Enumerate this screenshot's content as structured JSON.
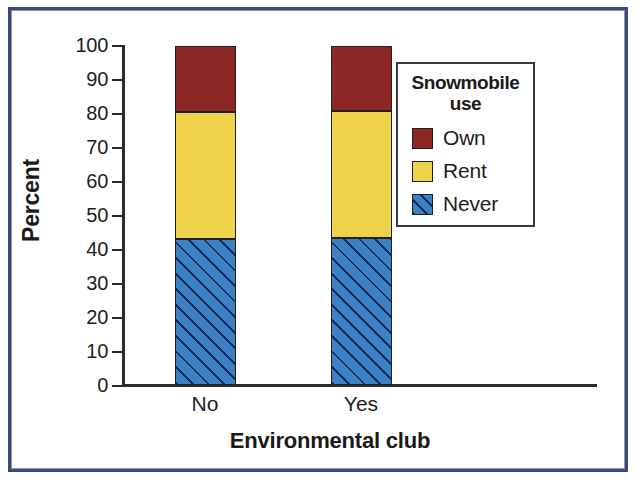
{
  "figure": {
    "border_color": "#3c4a79",
    "background": "#ffffff"
  },
  "chart_data": {
    "type": "bar",
    "subtype": "stacked-percentage",
    "title": "",
    "xlabel": "Environmental club",
    "ylabel": "Percent",
    "categories": [
      "No",
      "Yes"
    ],
    "ylim": [
      0,
      100
    ],
    "yticks": [
      0,
      10,
      20,
      30,
      40,
      50,
      60,
      70,
      80,
      90,
      100
    ],
    "ytick_labels": [
      "0",
      "10",
      "20",
      "30",
      "40",
      "50",
      "60",
      "70",
      "80",
      "90",
      "100"
    ],
    "grid": false,
    "legend_position": "right-inside",
    "legend_title": "Snowmobile use",
    "series": [
      {
        "name": "Never",
        "color": "#3b81c4",
        "hatch": "diagonal-45",
        "values": [
          43.2,
          43.4
        ],
        "stack_order": 0
      },
      {
        "name": "Rent",
        "color": "#eed24a",
        "hatch": "none",
        "values": [
          37.3,
          37.2
        ],
        "stack_order": 1
      },
      {
        "name": "Own",
        "color": "#8d2724",
        "hatch": "none",
        "values": [
          19.5,
          19.4
        ],
        "stack_order": 2
      }
    ],
    "stack_tops": {
      "No": {
        "never": 43.2,
        "rent": 80.5,
        "own": 100
      },
      "Yes": {
        "never": 43.4,
        "rent": 80.6,
        "own": 100
      }
    }
  },
  "legend": {
    "title_line1": "Snowmobile",
    "title_line2": "use",
    "items": [
      {
        "label": "Own",
        "color": "#8d2724"
      },
      {
        "label": "Rent",
        "color": "#eed24a"
      },
      {
        "label": "Never",
        "color": "#3b81c4"
      }
    ]
  }
}
